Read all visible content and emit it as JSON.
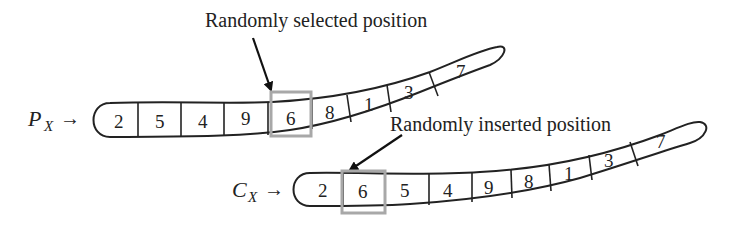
{
  "annotations": {
    "selected_label": "Randomly selected position",
    "inserted_label": "Randomly inserted position"
  },
  "parent": {
    "var": "P",
    "sub": "X",
    "arrow": "→",
    "cells": [
      "2",
      "5",
      "4",
      "9",
      "6",
      "8",
      "1",
      "3",
      "7"
    ],
    "selected_index": 4
  },
  "child": {
    "var": "C",
    "sub": "X",
    "arrow": "→",
    "cells": [
      "2",
      "6",
      "5",
      "4",
      "9",
      "8",
      "1",
      "3",
      "7"
    ],
    "inserted_index": 1
  },
  "colors": {
    "line": "#222222",
    "highlight": "#a8a8a8"
  }
}
